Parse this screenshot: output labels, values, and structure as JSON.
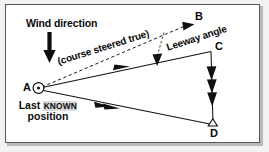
{
  "diagram": {
    "background_color": "#ffffff",
    "frame_color": "#58585a",
    "ink_color": "#0b0b0b",
    "labels": {
      "wind_direction": "Wind direction",
      "point_a": "A",
      "point_b": "B",
      "point_c": "C",
      "point_d": "D",
      "last_known_prefix": "Last",
      "last_known_emphasis": "KNOWN",
      "last_known_suffix": "position",
      "course_steered": "(course steered true)",
      "leeway_angle": "Leeway angle"
    },
    "points": [
      {
        "id": "A",
        "label": "A",
        "x": 38,
        "y": 88,
        "marker": "circle-dot",
        "description": "Last known position"
      },
      {
        "id": "B",
        "label": "B",
        "x": 192,
        "y": 24,
        "marker": "arrowhead",
        "description": "End of dashed course line"
      },
      {
        "id": "C",
        "label": "C",
        "x": 211,
        "y": 51,
        "marker": "vertex",
        "description": "End of water track"
      },
      {
        "id": "D",
        "label": "D",
        "x": 213,
        "y": 125,
        "marker": "triangle",
        "description": "Estimated position after drift"
      }
    ],
    "vectors": [
      {
        "id": "AB",
        "from": "A",
        "to": "B",
        "style": "dashed",
        "arrowheads": 1,
        "label": ""
      },
      {
        "id": "AC",
        "from": "A",
        "to": "C",
        "style": "solid",
        "arrowheads": 1,
        "label": "(course steered true)"
      },
      {
        "id": "CD",
        "from": "C",
        "to": "D",
        "style": "solid",
        "arrowheads": 3,
        "label": ""
      },
      {
        "id": "AD",
        "from": "A",
        "to": "D",
        "style": "solid",
        "arrowheads": 2,
        "label": ""
      }
    ],
    "annotations": [
      {
        "id": "wind-arrow",
        "type": "thick-down-arrow",
        "x": 50,
        "y_start": 33,
        "y_end": 62
      },
      {
        "id": "leeway-marker",
        "type": "dashed-drop-arrow",
        "from_x": 163,
        "from_y": 33,
        "to_x": 157,
        "to_y": 62
      }
    ]
  }
}
